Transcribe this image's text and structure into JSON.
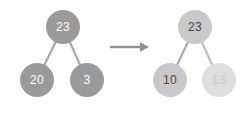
{
  "diagram": {
    "type": "binary-tree-transformation",
    "arrow": {
      "symbol": "→",
      "name": "transform-arrow",
      "color": "#8f8f8f"
    },
    "before": {
      "caption": "",
      "nodes": [
        {
          "id": "b-root",
          "label": "23",
          "role": "root",
          "style": "dark",
          "cx": 63,
          "cy": 27,
          "r": 17
        },
        {
          "id": "b-left",
          "label": "20",
          "role": "left-child",
          "style": "dark",
          "cx": 37,
          "cy": 80,
          "r": 17
        },
        {
          "id": "b-right",
          "label": "3",
          "role": "right-child",
          "style": "dark",
          "cx": 87,
          "cy": 80,
          "r": 17
        }
      ],
      "edges": [
        {
          "from": "b-root",
          "to": "b-left"
        },
        {
          "from": "b-root",
          "to": "b-right"
        }
      ]
    },
    "after": {
      "caption": "",
      "nodes": [
        {
          "id": "a-root",
          "label": "23",
          "role": "root",
          "style": "light",
          "cx": 195,
          "cy": 27,
          "r": 17
        },
        {
          "id": "a-left",
          "label": "10",
          "role": "left-child",
          "style": "light",
          "cx": 170,
          "cy": 80,
          "r": 17
        },
        {
          "id": "a-right",
          "label": "13",
          "role": "right-child",
          "style": "ghost",
          "cx": 219,
          "cy": 80,
          "r": 17
        }
      ],
      "edges": [
        {
          "from": "a-root",
          "to": "a-left"
        },
        {
          "from": "a-root",
          "to": "a-right"
        }
      ]
    },
    "colors": {
      "dark_node": "#9a9a9a",
      "light_node": "#c9c9c9",
      "ghost_node": "#dedede",
      "edge": "#a8a8a8",
      "ghost_edge": "#d8d8d8",
      "dark_text": "#4a4a4a",
      "light_text": "#ffffff",
      "ghost_text": "#cccccc",
      "background": "#ffffff"
    }
  }
}
